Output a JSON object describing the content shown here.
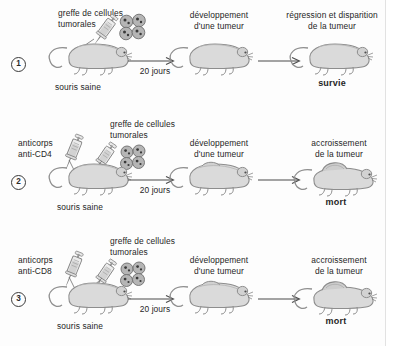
{
  "document": {
    "title": "Expériences de greffe de cellules tumorales chez la souris",
    "language": "fr",
    "background_color": "#fdfdfd",
    "text_color": "#262626"
  },
  "common": {
    "healthy_mouse_label": "souris saine",
    "delay_label": "20 jours",
    "tumor_cells_label": "greffe de cellules\ntumorales",
    "tumor_dev_label": "développement\nd'une tumeur",
    "mouse_icon": "mouse-icon",
    "syringe_icon": "syringe-icon",
    "tumor-cells_icon": "tumor-cell-cluster-icon",
    "arrow_icon": "arrow-right-icon"
  },
  "experiments": [
    {
      "number": "1",
      "antibody_label": "",
      "graft_label": "greffe de cellules\ntumorales",
      "start_mouse_label": "souris saine",
      "delay_label": "20 jours",
      "middle_label": "développement\nd'une tumeur",
      "outcome_label": "régression et disparition\nde la tumeur",
      "result": "survie",
      "has_antibody": false,
      "final_tumor": false
    },
    {
      "number": "2",
      "antibody_label": "anticorps\nanti-CD4",
      "graft_label": "greffe de cellules\ntumorales",
      "start_mouse_label": "souris saine",
      "delay_label": "20 jours",
      "middle_label": "développement\nd'une tumeur",
      "outcome_label": "accroissement\nde la tumeur",
      "result": "mort",
      "has_antibody": true,
      "final_tumor": true
    },
    {
      "number": "3",
      "antibody_label": "anticorps\nanti-CD8",
      "graft_label": "greffe de cellules\ntumorales",
      "start_mouse_label": "souris saine",
      "delay_label": "20 jours",
      "middle_label": "développement\nd'une tumeur",
      "outcome_label": "accroissement\nde la tumeur",
      "result": "mort",
      "has_antibody": true,
      "final_tumor": true
    }
  ],
  "colors": {
    "mouse_body": "#d9d9d9",
    "mouse_outline": "#8a8a8a",
    "mouse_shadow": "#bdbdbd",
    "cell_fill": "#b3b3b3",
    "cell_outline": "#6e6e6e",
    "cell_nucleus": "#3d3d3d",
    "syringe_fill": "#e3e3e3",
    "syringe_outline": "#8a8a8a",
    "arrow": "#4a4a4a"
  }
}
